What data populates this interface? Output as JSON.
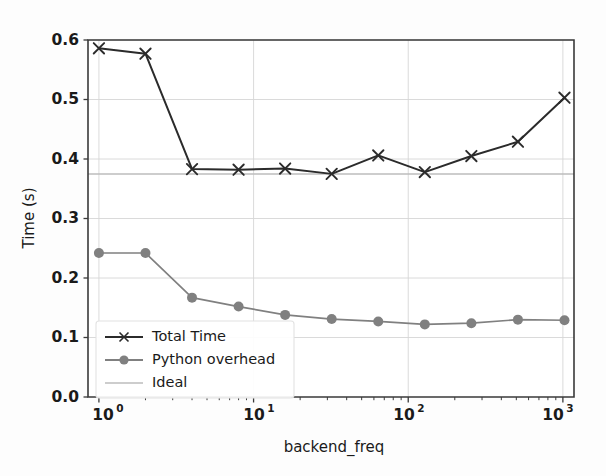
{
  "chart_data": {
    "type": "line",
    "title": "",
    "xlabel": "backend_freq",
    "ylabel": "Time (s)",
    "xscale": "log",
    "yscale": "linear",
    "xlim": [
      0.85,
      1180
    ],
    "ylim": [
      0.0,
      0.6
    ],
    "grid": true,
    "legend_position": "lower left",
    "x": [
      1,
      2,
      4,
      8,
      16,
      32,
      64,
      128,
      256,
      512,
      1024
    ],
    "xtick_labels": [
      "10^0",
      "10^1",
      "10^2",
      "10^3"
    ],
    "xtick_values": [
      1,
      10,
      100,
      1000
    ],
    "ytick_labels": [
      "0.0",
      "0.1",
      "0.2",
      "0.3",
      "0.4",
      "0.5",
      "0.6"
    ],
    "ytick_values": [
      0.0,
      0.1,
      0.2,
      0.3,
      0.4,
      0.5,
      0.6
    ],
    "series": [
      {
        "name": "Total Time",
        "marker": "x",
        "color": "#2b2b2b",
        "values": [
          0.586,
          0.577,
          0.383,
          0.382,
          0.384,
          0.375,
          0.406,
          0.378,
          0.405,
          0.429,
          0.503
        ]
      },
      {
        "name": "Python overhead",
        "marker": "o",
        "color": "#808080",
        "values": [
          0.242,
          0.242,
          0.167,
          0.152,
          0.138,
          0.131,
          0.127,
          0.122,
          0.124,
          0.13,
          0.129
        ]
      },
      {
        "name": "Ideal",
        "marker": "none",
        "color": "#bdbdbd",
        "constant_value": 0.375
      }
    ]
  },
  "legend": {
    "entries": [
      {
        "label": "Total Time",
        "marker": "x",
        "color": "#2b2b2b"
      },
      {
        "label": "Python overhead",
        "marker": "o",
        "color": "#808080"
      },
      {
        "label": "Ideal",
        "marker": "none",
        "color": "#bdbdbd"
      }
    ]
  },
  "axes": {
    "ylabel": "Time (s)",
    "xlabel": "backend_freq",
    "ytick_0": "0.0",
    "ytick_1": "0.1",
    "ytick_2": "0.2",
    "ytick_3": "0.3",
    "ytick_4": "0.4",
    "ytick_5": "0.5",
    "ytick_6": "0.6",
    "xtick_0_mantissa": "10",
    "xtick_0_exp": "0",
    "xtick_1_mantissa": "10",
    "xtick_1_exp": "1",
    "xtick_2_mantissa": "10",
    "xtick_2_exp": "2",
    "xtick_3_mantissa": "10",
    "xtick_3_exp": "3"
  },
  "colors": {
    "total_time": "#2b2b2b",
    "python_overhead": "#808080",
    "ideal": "#bdbdbd",
    "grid": "#d6d6d6",
    "spine": "#3a3a3a",
    "background": "#fdfdfd"
  }
}
